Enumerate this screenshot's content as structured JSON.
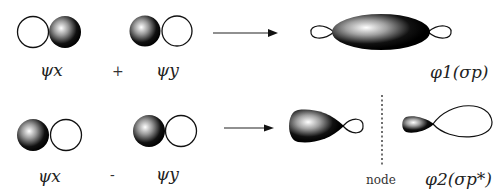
{
  "diagram": {
    "title": "",
    "row1": {
      "left_label": "ψx",
      "operator": "+",
      "right_label": "ψy",
      "result_label": "φ1(σp)"
    },
    "row2": {
      "left_label": "ψx",
      "operator": "-",
      "right_label": "ψy",
      "node_label": "node",
      "result_label": "φ2(σp*)"
    },
    "colors": {
      "lobe_fill_dark": "#000000",
      "lobe_highlight": "#ffffff",
      "outline": "#111111",
      "background": "#ffffff"
    }
  }
}
